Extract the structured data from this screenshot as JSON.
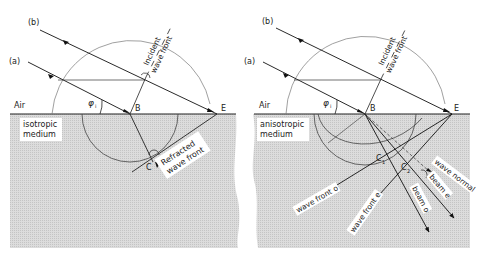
{
  "figure": {
    "left_panel": {
      "ray_a_label": "(a)",
      "ray_b_label": "(b)",
      "upper_medium_label": "Air",
      "lower_medium_label_line1": "isotropic",
      "lower_medium_label_line2": "medium",
      "angle_label": "φ",
      "angle_subscript": "i",
      "point_B": "B",
      "point_E": "E",
      "point_C": "C",
      "incident_wavefront_line1": "Incident",
      "incident_wavefront_line2": "wave front",
      "refracted_wavefront_line1": "Refracted",
      "refracted_wavefront_line2": "wave front"
    },
    "right_panel": {
      "ray_a_label": "(a)",
      "ray_b_label": "(b)",
      "upper_medium_label": "Air",
      "lower_medium_label_line1": "anisotropic",
      "lower_medium_label_line2": "medium",
      "angle_label": "φ",
      "angle_subscript": "i",
      "point_B": "B",
      "point_E": "E",
      "point_C1": "C",
      "point_C1_sub": "1",
      "point_C2": "C",
      "point_C2_sub": "2",
      "incident_wavefront_line1": "Incident",
      "incident_wavefront_line2": "wave front",
      "wave_front_o": "wave front o",
      "wave_front_e": "wave front e",
      "beam_o": "beam o",
      "beam_e": "beam e",
      "wave_normal": "wave normal"
    },
    "colors": {
      "medium_fill": "#d6d6d6",
      "line": "#222222",
      "thin_line": "#555555",
      "background": "#ffffff"
    }
  }
}
